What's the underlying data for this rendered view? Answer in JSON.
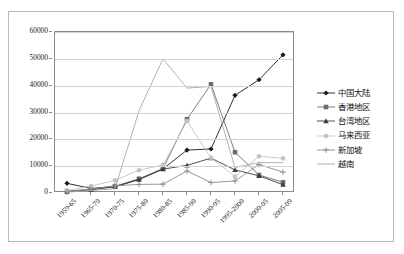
{
  "chart_data": {
    "type": "line",
    "title": "",
    "subtitle": "",
    "xlabel": "",
    "ylabel": "",
    "ylim": [
      0,
      60000
    ],
    "xlim_categories_count": 10,
    "grid": true,
    "legend_position": "right",
    "y_ticks": [
      "0",
      "10000",
      "20000",
      "30000",
      "40000",
      "50000",
      "60000"
    ],
    "y_tick_values": [
      0,
      10000,
      20000,
      30000,
      40000,
      50000,
      60000
    ],
    "categories": [
      "1959-65",
      "1965-70",
      "1970-75",
      "1975-80",
      "1980-85",
      "1985-90",
      "1990-95",
      "1995-2000",
      "2000-05",
      "2005-09"
    ],
    "series": [
      {
        "name": "中国大陆",
        "marker": "diamond",
        "color": "#1b1b1b",
        "values": [
          3600,
          1700,
          2400,
          5100,
          9000,
          16000,
          16400,
          36400,
          42200,
          51500
        ]
      },
      {
        "name": "香港地区",
        "marker": "square",
        "color": "#6e6e6e",
        "values": [
          700,
          1300,
          2500,
          5300,
          9100,
          27500,
          40500,
          15200,
          6700,
          4000
        ]
      },
      {
        "name": "台湾地区",
        "marker": "triangle",
        "color": "#3c3c3c",
        "values": [
          500,
          1200,
          2300,
          5000,
          8900,
          10300,
          13000,
          8600,
          6400,
          3100
        ]
      },
      {
        "name": "马来西亚",
        "marker": "circle",
        "color": "#c3c3c3",
        "values": [
          900,
          2600,
          4700,
          8500,
          10500,
          26800,
          13100,
          6100,
          13700,
          12900
        ]
      },
      {
        "name": "新加坡",
        "marker": "plus",
        "color": "#8d8d8d",
        "values": [
          600,
          1500,
          2700,
          3200,
          3300,
          8200,
          3900,
          4500,
          10600,
          7800
        ]
      },
      {
        "name": "越南",
        "marker": "none",
        "color": "#a8a8a8",
        "values": [
          300,
          900,
          1600,
          30700,
          50000,
          39100,
          39700,
          9500,
          11300,
          11300
        ]
      }
    ]
  }
}
